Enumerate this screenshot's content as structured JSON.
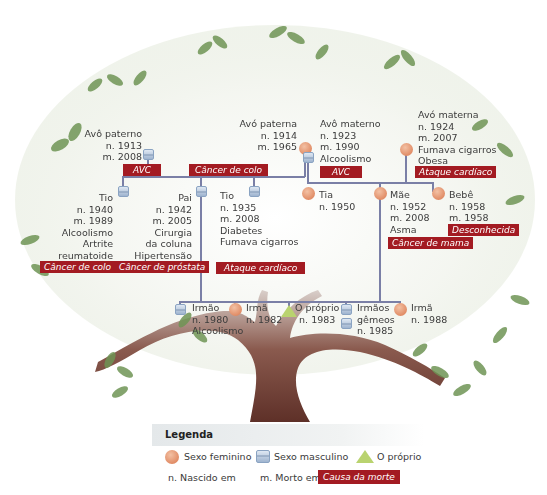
{
  "legend": {
    "title": "Legenda",
    "female": "Sexo feminino",
    "male": "Sexo masculino",
    "self": "O próprio",
    "born": "n. Nascido em",
    "died": "m. Morto em",
    "cause": "Causa da morte"
  },
  "colors": {
    "cause_bg": "#a31b22",
    "line": "#7a7fa6",
    "female": "#d9764c",
    "male": "#9fb4cf",
    "self": "#b9d36f",
    "trunk": "#6b3b33",
    "leaf": "#5f8a48"
  },
  "generation1": {
    "paternal_grandfather": {
      "lines": [
        "Avô paterno",
        "n. 1913",
        "m. 2008"
      ],
      "cause": "AVC"
    },
    "paternal_grandmother": {
      "lines": [
        "Avó paterna",
        "n. 1914",
        "m. 1965"
      ],
      "cause": "Câncer de colo"
    },
    "maternal_grandfather": {
      "lines": [
        "Avô materno",
        "n. 1923",
        "m. 1990",
        "Alcoolismo"
      ],
      "cause": "AVC"
    },
    "maternal_grandmother": {
      "lines": [
        "Avó materna",
        "n. 1924",
        "m. 2007",
        "Fumava cigarros",
        "Obesa"
      ],
      "cause": "Ataque cardíaco"
    }
  },
  "generation2": {
    "uncle_1940": {
      "lines": [
        "Tio",
        "n. 1940",
        "m. 1989",
        "Alcoolismo",
        "Artrite",
        "reumatoide"
      ],
      "cause": "Câncer de colo"
    },
    "father": {
      "lines": [
        "Pai",
        "n. 1942",
        "m. 2005",
        "Cirurgia",
        "da coluna",
        "Hipertensão"
      ],
      "cause": "Câncer de próstata"
    },
    "uncle_1935": {
      "lines": [
        "Tio",
        "n. 1935",
        "m. 2008",
        "Diabetes",
        "Fumava cigarros"
      ],
      "cause": "Ataque cardíaco"
    },
    "aunt": {
      "lines": [
        "Tia",
        "n. 1950"
      ]
    },
    "mother": {
      "lines": [
        "Mãe",
        "n. 1952",
        "m. 2008",
        "Asma"
      ],
      "cause": "Câncer de mama"
    },
    "baby": {
      "lines": [
        "Bebê",
        "n. 1958",
        "m. 1958"
      ],
      "cause": "Desconhecida"
    }
  },
  "generation3": {
    "brother": {
      "lines": [
        "Irmão",
        "n. 1980",
        "Alcoolismo"
      ]
    },
    "sister_1982": {
      "lines": [
        "Irmã",
        "n. 1982"
      ]
    },
    "self": {
      "lines": [
        "O próprio",
        "n. 1983"
      ]
    },
    "twins": {
      "lines": [
        "Irmãos",
        "gêmeos",
        "n. 1985"
      ]
    },
    "sister_1988": {
      "lines": [
        "Irmã",
        "n. 1988"
      ]
    }
  }
}
